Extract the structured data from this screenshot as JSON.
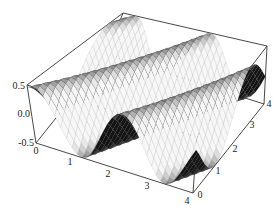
{
  "chart_data": {
    "type": "surface3d",
    "title": "",
    "xlabel": "",
    "ylabel": "",
    "zlabel": "",
    "x_range": [
      0,
      4
    ],
    "y_range": [
      0,
      4
    ],
    "z_range": [
      -0.5,
      0.5
    ],
    "x_ticks": [
      "0",
      "1",
      "2",
      "3",
      "4"
    ],
    "y_ticks": [
      "0",
      "1",
      "2",
      "3",
      "4"
    ],
    "z_ticks": [
      "0.5",
      "0.0",
      "-0.5"
    ],
    "z_tick_values": [
      0.5,
      0.0,
      -0.5
    ],
    "x_tick_values": [
      0,
      1,
      2,
      3,
      4
    ],
    "y_tick_values": [
      0,
      1,
      2,
      3,
      4
    ],
    "surface": {
      "description": "sinusoidal ridges running diagonally across x-y domain, amplitude 0.5",
      "amplitude": 0.5,
      "mesh": true,
      "shading": "grayscale"
    },
    "grid": false,
    "boxed": true
  }
}
